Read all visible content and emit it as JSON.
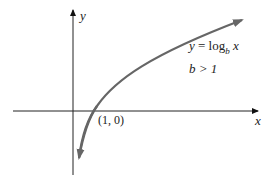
{
  "diagram": {
    "axes": {
      "x_label": "x",
      "y_label": "y"
    },
    "curve": {
      "equation_lhs": "y",
      "equation_eq": " = log",
      "equation_base": "b",
      "equation_arg": " x",
      "condition": "b > 1",
      "color": "#666666"
    },
    "point_label": "(1, 0)"
  }
}
